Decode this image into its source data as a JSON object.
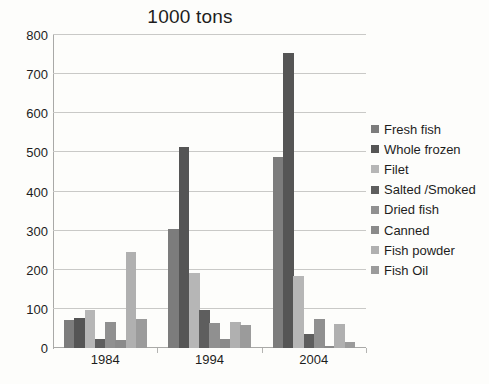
{
  "chart_data": {
    "type": "bar",
    "title": "1000 tons",
    "xlabel": "",
    "ylabel": "",
    "ylim": [
      0,
      800
    ],
    "ytick_step": 100,
    "yticks": [
      800,
      700,
      600,
      500,
      400,
      300,
      200,
      100,
      0
    ],
    "grid": true,
    "legend_position": "right",
    "categories": [
      "1984",
      "1994",
      "2004"
    ],
    "series": [
      {
        "name": "Fresh fish",
        "color": "#7c7c7c",
        "values": [
          72,
          305,
          488
        ]
      },
      {
        "name": "Whole frozen",
        "color": "#555555",
        "values": [
          77,
          515,
          755
        ]
      },
      {
        "name": "Filet",
        "color": "#b6b6b6",
        "values": [
          97,
          192,
          185
        ]
      },
      {
        "name": "Salted /Smoked",
        "color": "#5e5e5e",
        "values": [
          23,
          97,
          37
        ]
      },
      {
        "name": "Dried fish",
        "color": "#909090",
        "values": [
          67,
          63,
          75
        ]
      },
      {
        "name": "Canned",
        "color": "#8a8a8a",
        "values": [
          20,
          22,
          5
        ]
      },
      {
        "name": "Fish powder",
        "color": "#b0b0b0",
        "values": [
          245,
          67,
          62
        ]
      },
      {
        "name": "Fish Oil",
        "color": "#9b9b9b",
        "values": [
          75,
          60,
          16
        ]
      }
    ]
  }
}
